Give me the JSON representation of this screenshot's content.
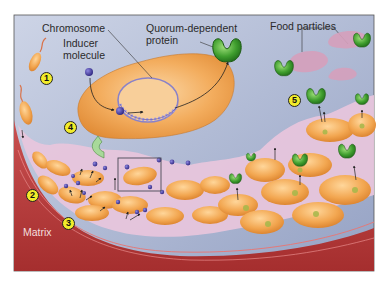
{
  "figure": {
    "labels": {
      "chromosome": "Chromosome",
      "inducer_line1": "Inducer",
      "inducer_line2": "molecule",
      "quorum_line1": "Quorum-dependent",
      "quorum_line2": "protein",
      "food": "Food particles",
      "matrix": "Matrix"
    },
    "steps": [
      "1",
      "2",
      "3",
      "4",
      "5"
    ],
    "colors": {
      "background_top": "#c8d0e4",
      "background_bottom": "#9eaacb",
      "cell_fill": "#f0a24a",
      "cell_highlight": "#ffd08a",
      "protein_green": "#3c9a2e",
      "inducer_purple": "#4a3fa0",
      "food_pink": "#d7a3bd",
      "matrix_pink": "#e8c4dc",
      "surface_red": "#b93a3a",
      "step_badge": "#f2ec2a"
    }
  }
}
